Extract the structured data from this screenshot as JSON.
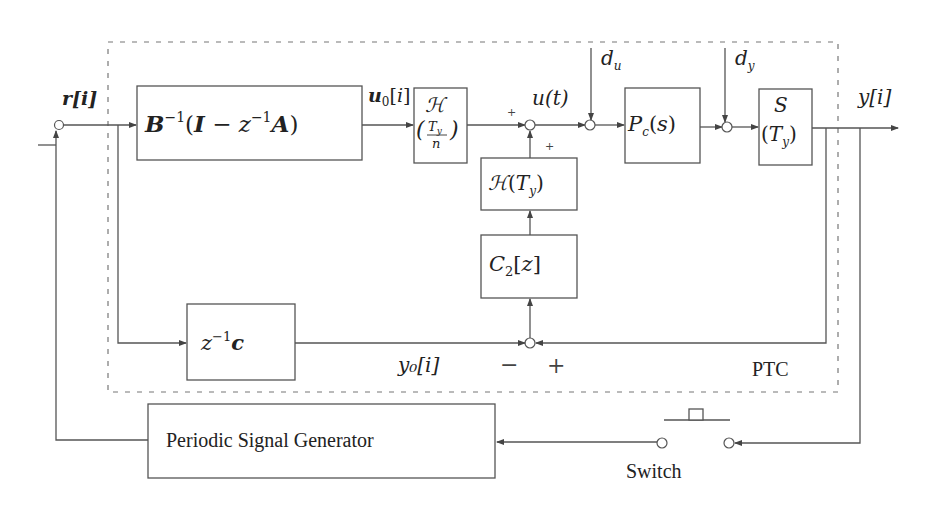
{
  "diagram": {
    "container_label": "PTC",
    "signals": {
      "reference": "r[i]",
      "u0": "u₀[i]",
      "u_t": "u(t)",
      "d_u": "d",
      "d_u_sub": "u",
      "d_y": "d",
      "d_y_sub": "y",
      "output": "y[i]",
      "y0": "y₀[i]"
    },
    "blocks": {
      "b_inverse": {
        "main": "B",
        "sup": "−1",
        "rest": "(I − z",
        "sup2": "−1",
        "tail": "A)"
      },
      "hold_fast": {
        "top": "ℋ",
        "num": "T",
        "num_sub": "y",
        "den": "n"
      },
      "hold_slow": {
        "main": "ℋ(T",
        "sub": "y",
        "tail": ")"
      },
      "controller": {
        "main": "C",
        "sub": "2",
        "tail": "[z]"
      },
      "plant": {
        "main": "P",
        "sub": "c",
        "tail": "(s)"
      },
      "sampler": {
        "top": "𝒮",
        "main": "(T",
        "sub": "y",
        "tail": ")"
      },
      "delay_c": {
        "main": "z",
        "sup": "−1",
        "tail": "c"
      },
      "generator": {
        "label": "Periodic Signal Generator"
      }
    },
    "switch": {
      "label": "Switch"
    },
    "signs": {
      "sum1_left": "+",
      "sum1_bottom": "+",
      "bottom_minus": "−",
      "bottom_plus": "+"
    },
    "colors": {
      "line": "#555555",
      "text": "#222222",
      "dashed": "#777777"
    }
  }
}
